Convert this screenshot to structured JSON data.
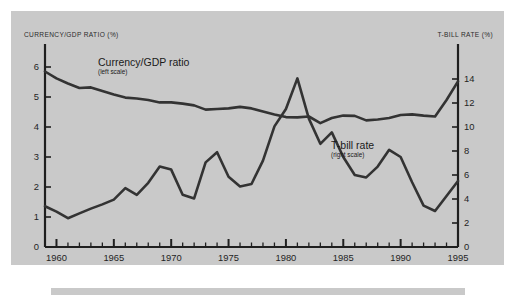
{
  "figure": {
    "background_color": "#ffffff",
    "panel_color": "#c9c9c9",
    "line_color": "#333333",
    "axis_color": "#1f1f1f"
  },
  "labels": {
    "left_axis_title": "CURRENCY/GDP RATIO (%)",
    "right_axis_title": "T-BILL RATE (%)",
    "currency_series_name": "Currency/GDP ratio",
    "currency_series_scale": "(left scale)",
    "tbill_series_name": "T-bill rate",
    "tbill_series_scale": "(right scale)"
  },
  "chart_data": {
    "type": "line",
    "title": "",
    "subtitle": "",
    "xlabel": "",
    "ylabel": "CURRENCY/GDP RATIO (%)",
    "y2label": "T-BILL RATE (%)",
    "grid": false,
    "legend": "inline-annotations",
    "xlim": [
      1959,
      1995
    ],
    "ylim": [
      0,
      6.4
    ],
    "y2lim": [
      0,
      16
    ],
    "xticks": [
      1960,
      1965,
      1970,
      1975,
      1980,
      1985,
      1990,
      1995
    ],
    "xtick_labels": [
      "1960",
      "1965",
      "1970",
      "1975",
      "1980",
      "1985",
      "1990",
      "1995"
    ],
    "xticks_minor_step": 1,
    "yticks": [
      0,
      1,
      2,
      3,
      4,
      5,
      6
    ],
    "ytick_labels": [
      "0",
      "1",
      "2",
      "3",
      "4",
      "5",
      "6"
    ],
    "y2ticks": [
      0,
      2,
      4,
      6,
      8,
      10,
      12,
      14
    ],
    "y2tick_labels": [
      "0",
      "2",
      "4",
      "6",
      "8",
      "10",
      "12",
      "14"
    ],
    "x": [
      1959,
      1960,
      1961,
      1962,
      1963,
      1964,
      1965,
      1966,
      1967,
      1968,
      1969,
      1970,
      1971,
      1972,
      1973,
      1974,
      1975,
      1976,
      1977,
      1978,
      1979,
      1980,
      1981,
      1982,
      1983,
      1984,
      1985,
      1986,
      1987,
      1988,
      1989,
      1990,
      1991,
      1992,
      1993,
      1994,
      1995
    ],
    "series": [
      {
        "name": "Currency/GDP ratio",
        "axis": "left",
        "scale_note": "(left scale)",
        "values": [
          5.85,
          5.62,
          5.45,
          5.3,
          5.32,
          5.2,
          5.08,
          4.98,
          4.95,
          4.9,
          4.82,
          4.82,
          4.78,
          4.72,
          4.58,
          4.6,
          4.62,
          4.67,
          4.62,
          4.52,
          4.42,
          4.33,
          4.32,
          4.35,
          4.13,
          4.3,
          4.38,
          4.37,
          4.22,
          4.25,
          4.3,
          4.4,
          4.42,
          4.38,
          4.35,
          4.9,
          5.52
        ]
      },
      {
        "name": "T-bill rate",
        "axis": "right",
        "scale_note": "(right scale)",
        "values": [
          3.4,
          2.95,
          2.4,
          2.8,
          3.2,
          3.55,
          3.95,
          4.9,
          4.35,
          5.35,
          6.7,
          6.45,
          4.35,
          4.05,
          7.05,
          7.9,
          5.85,
          5.05,
          5.25,
          7.2,
          10.05,
          11.5,
          14.05,
          10.7,
          8.6,
          9.55,
          7.5,
          6.0,
          5.8,
          6.7,
          8.1,
          7.5,
          5.4,
          3.45,
          3.0,
          4.25,
          5.5
        ]
      }
    ],
    "annotations": [
      {
        "text": "Currency/GDP ratio",
        "sub": "(left scale)",
        "series": "Currency/GDP ratio"
      },
      {
        "text": "T-bill rate",
        "sub": "(right scale)",
        "series": "T-bill rate"
      }
    ]
  }
}
